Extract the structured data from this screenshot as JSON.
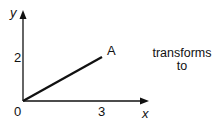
{
  "diagram": {
    "axes": {
      "x_label": "x",
      "y_label": "y",
      "origin_label": "0"
    },
    "ticks": {
      "x_tick": "3",
      "y_tick": "2"
    },
    "segment": {
      "from": [
        0,
        0
      ],
      "to": [
        3,
        2
      ],
      "end_label": "A"
    },
    "caption_line1": "transforms",
    "caption_line2": "to"
  }
}
